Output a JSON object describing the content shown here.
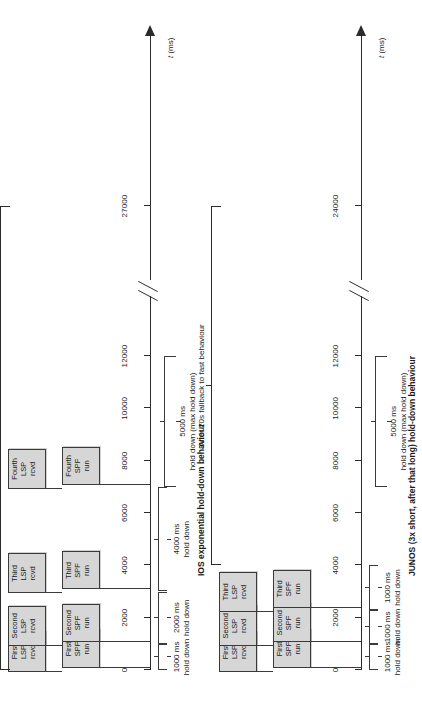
{
  "figure": {
    "axis_label": "t (ms)",
    "axis_label_italic_part": "t",
    "axis_label_unit_part": " (ms)"
  },
  "panels": [
    {
      "id": "ios",
      "caption": "IOS exponential hold-down behaviour",
      "fallback_note": "After 20 s fallback to fast behaviour",
      "axis": {
        "ticks": [
          {
            "value": 0,
            "label": "0"
          },
          {
            "value": 2000,
            "label": "2000"
          },
          {
            "value": 4000,
            "label": "4000"
          },
          {
            "value": 6000,
            "label": "6000"
          },
          {
            "value": 8000,
            "label": "8000"
          },
          {
            "value": 10000,
            "label": "10000"
          },
          {
            "value": 12000,
            "label": "12000"
          },
          {
            "value": 27000,
            "label": "27000"
          }
        ],
        "break_after": 12000,
        "max_label": "27000"
      },
      "events": [
        {
          "time": 0,
          "lsp": "First\nLSP\nrcvd",
          "spf": "First\nSPF\nrun"
        },
        {
          "time": 1000,
          "lsp": "Second\nLSP\nrcvd",
          "spf": "Second\nSPF\nrun"
        },
        {
          "time": 3000,
          "lsp": "Third\nLSP\nrcvd",
          "spf": "Third\nSPF\nrun"
        },
        {
          "time": 7000,
          "lsp": "Fourth\nLSP\nrcvd",
          "spf": "Fourth\nSPF\nrun"
        }
      ],
      "holddowns": [
        {
          "from": 0,
          "to": 1000,
          "label": "1000 ms\nhold down"
        },
        {
          "from": 1000,
          "to": 3000,
          "label": "2000 ms\nhold down"
        },
        {
          "from": 3000,
          "to": 7000,
          "label": "4000 ms\nhold down"
        },
        {
          "from": 7000,
          "to": 12000,
          "label": "5000 ms\nhold down (max hold down)"
        }
      ]
    },
    {
      "id": "junos",
      "caption": "JUNOS (3x short, after that long) hold-down behaviour",
      "fallback_note": "After 20s fallback to fast behaviour",
      "axis": {
        "ticks": [
          {
            "value": 0,
            "label": "0"
          },
          {
            "value": 2000,
            "label": "2000"
          },
          {
            "value": 4000,
            "label": "4000"
          },
          {
            "value": 6000,
            "label": "6000"
          },
          {
            "value": 8000,
            "label": "8000"
          },
          {
            "value": 10000,
            "label": "10000"
          },
          {
            "value": 12000,
            "label": "12000"
          },
          {
            "value": 24000,
            "label": "24000"
          }
        ],
        "break_after": 12000,
        "max_label": "24000"
      },
      "events": [
        {
          "time": 0,
          "lsp": "First\nLSP\nrcvd",
          "spf": "First\nSPF\nrun"
        },
        {
          "time": 1000,
          "lsp": "Second\nLSP\nrcvd",
          "spf": "Second\nSPF\nrun"
        },
        {
          "time": 2300,
          "lsp": "Third\nLSP\nrcvd",
          "spf": "Third\nSPF\nrun"
        }
      ],
      "holddowns": [
        {
          "from": 0,
          "to": 1000,
          "label": "1000 ms\nhold down"
        },
        {
          "from": 1000,
          "to": 2300,
          "label": "1000 ms\nhold down"
        },
        {
          "from": 2300,
          "to": 4000,
          "label": "1000 ms\nhold down"
        },
        {
          "from": 7000,
          "to": 12000,
          "label": "5000 ms\nhold down (max hold down)"
        }
      ]
    }
  ],
  "chart_data": {
    "type": "timeline",
    "xlabel": "t (ms)",
    "grid": false,
    "legend": null,
    "charts": [
      {
        "name": "IOS exponential hold-down behaviour",
        "xlim": [
          0,
          27000
        ],
        "axis_break": [
          12500,
          26000
        ],
        "xticks": [
          0,
          2000,
          4000,
          6000,
          8000,
          10000,
          12000,
          27000
        ],
        "xticklabels": [
          "0",
          "2000",
          "4000",
          "6000",
          "8000",
          "10000",
          "12000",
          "27000"
        ],
        "events": [
          {
            "t": 0,
            "lsp": "First LSP rcvd",
            "spf": "First SPF run"
          },
          {
            "t": 1000,
            "lsp": "Second LSP rcvd",
            "spf": "Second SPF run"
          },
          {
            "t": 3000,
            "lsp": "Third LSP rcvd",
            "spf": "Third SPF run"
          },
          {
            "t": 7000,
            "lsp": "Fourth LSP rcvd",
            "spf": "Fourth SPF run"
          }
        ],
        "intervals": [
          {
            "start": 0,
            "end": 1000,
            "ms": 1000,
            "label": "1000 ms hold down"
          },
          {
            "start": 1000,
            "end": 3000,
            "ms": 2000,
            "label": "2000 ms hold down"
          },
          {
            "start": 3000,
            "end": 7000,
            "ms": 4000,
            "label": "4000 ms hold down"
          },
          {
            "start": 7000,
            "end": 12000,
            "ms": 5000,
            "label": "5000 ms hold down (max hold down)"
          }
        ],
        "annotations": [
          {
            "start": 0,
            "end": 27000,
            "text": "After 20 s fallback to fast behaviour"
          }
        ]
      },
      {
        "name": "JUNOS (3x short, after that long) hold-down behaviour",
        "xlim": [
          0,
          24000
        ],
        "axis_break": [
          12500,
          23000
        ],
        "xticks": [
          0,
          2000,
          4000,
          6000,
          8000,
          10000,
          12000,
          24000
        ],
        "xticklabels": [
          "0",
          "2000",
          "4000",
          "6000",
          "8000",
          "10000",
          "12000",
          "24000"
        ],
        "events": [
          {
            "t": 0,
            "lsp": "First LSP rcvd",
            "spf": "First SPF run"
          },
          {
            "t": 1000,
            "lsp": "Second LSP rcvd",
            "spf": "Second SPF run"
          },
          {
            "t": 2300,
            "lsp": "Third LSP rcvd",
            "spf": "Third SPF run"
          }
        ],
        "intervals": [
          {
            "start": 0,
            "end": 1000,
            "ms": 1000,
            "label": "1000 ms hold down"
          },
          {
            "start": 1000,
            "end": 2300,
            "ms": 1000,
            "label": "1000 ms hold down"
          },
          {
            "start": 2300,
            "end": 4000,
            "ms": 1000,
            "label": "1000 ms hold down"
          },
          {
            "start": 7000,
            "end": 12000,
            "ms": 5000,
            "label": "5000 ms hold down (max hold down)"
          }
        ],
        "annotations": [
          {
            "start": 4000,
            "end": 24000,
            "text": "After 20s fallback to fast behaviour"
          }
        ]
      }
    ]
  }
}
